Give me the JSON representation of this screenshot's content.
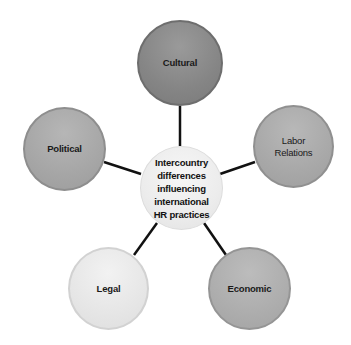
{
  "diagram": {
    "type": "hub-and-spoke",
    "center": {
      "lines": [
        "Intercountry",
        "differences",
        "influencing",
        "international",
        "HR practices"
      ],
      "color": "#ececec"
    },
    "nodes": [
      {
        "id": "cultural",
        "lines": [
          "Cultural"
        ],
        "color": "#858585"
      },
      {
        "id": "labor",
        "lines": [
          "Labor",
          "Relations"
        ],
        "color": "#a8a8a8"
      },
      {
        "id": "economic",
        "lines": [
          "Economic"
        ],
        "color": "#adadad"
      },
      {
        "id": "legal",
        "lines": [
          "Legal"
        ],
        "color": "#e6e6e6"
      },
      {
        "id": "political",
        "lines": [
          "Political"
        ],
        "color": "#a6a6a6"
      }
    ],
    "connector_color": "#111111",
    "connectors": [
      {
        "from": "center",
        "to": "cultural",
        "x1": 180,
        "y1": 146,
        "x2": 180,
        "y2": 106
      },
      {
        "from": "center",
        "to": "labor",
        "x1": 220,
        "y1": 174,
        "x2": 255,
        "y2": 162
      },
      {
        "from": "center",
        "to": "economic",
        "x1": 204,
        "y1": 223,
        "x2": 226,
        "y2": 255
      },
      {
        "from": "center",
        "to": "legal",
        "x1": 157,
        "y1": 223,
        "x2": 134,
        "y2": 255
      },
      {
        "from": "center",
        "to": "political",
        "x1": 141,
        "y1": 174,
        "x2": 104,
        "y2": 162
      }
    ]
  }
}
